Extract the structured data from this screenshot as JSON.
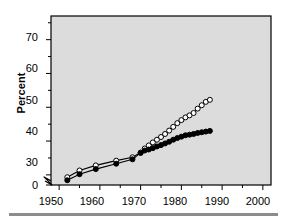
{
  "chart_data": {
    "type": "line",
    "title": "",
    "subtitle": "",
    "xlabel": "",
    "ylabel": "Percent",
    "xlim": [
      1948,
      2002
    ],
    "ylim": [
      27,
      77
    ],
    "y_axis_break": {
      "present": true,
      "from": 0,
      "to": 27,
      "zero_label": "0"
    },
    "grid": false,
    "legend_position": "inline-annotations",
    "plot_background": "#dcdcdc",
    "xticks": [
      1950,
      1960,
      1970,
      1980,
      1990,
      2000
    ],
    "xticklabels": [
      "1950",
      "1960",
      "1970",
      "1980",
      "1990",
      "2000"
    ],
    "xminor_ticks": [
      1955,
      1965,
      1975,
      1985,
      1995
    ],
    "yticks": [
      30,
      40,
      50,
      60,
      70
    ],
    "yticklabels": [
      "30",
      "40",
      "50",
      "60",
      "70"
    ],
    "yminor_ticks": [
      35,
      45,
      55,
      65,
      75
    ],
    "zero_tick_label": "0",
    "series": [
      {
        "name": "Percent of Female Population",
        "marker": "open-circle",
        "marker_fill": "#ffffff",
        "marker_edge": "#000000",
        "line_color": "#000000",
        "x": [
          1952,
          1955,
          1959,
          1964,
          1968,
          1970,
          1971,
          1972,
          1973,
          1974,
          1975,
          1976,
          1977,
          1978,
          1979,
          1980,
          1981,
          1982,
          1983,
          1984,
          1985,
          1986,
          1987
        ],
        "y": [
          29.3,
          31.3,
          32.8,
          34.2,
          35.2,
          36.6,
          37.8,
          38.7,
          39.6,
          40.4,
          41.2,
          42.1,
          43.1,
          44.2,
          45.3,
          46.2,
          47.0,
          47.6,
          48.3,
          49.6,
          50.6,
          51.6,
          52.2
        ]
      },
      {
        "name": "Percent of Labor Force",
        "marker": "filled-circle",
        "marker_fill": "#000000",
        "marker_edge": "#000000",
        "line_color": "#000000",
        "x": [
          1952,
          1955,
          1959,
          1964,
          1968,
          1970,
          1971,
          1972,
          1973,
          1974,
          1975,
          1976,
          1977,
          1978,
          1979,
          1980,
          1981,
          1982,
          1983,
          1984,
          1985,
          1986,
          1987
        ],
        "y": [
          28.4,
          30.2,
          31.7,
          33.3,
          34.6,
          36.5,
          37.2,
          37.5,
          37.9,
          38.4,
          38.8,
          39.3,
          39.8,
          40.4,
          40.9,
          41.3,
          41.7,
          41.9,
          42.1,
          42.4,
          42.6,
          42.8,
          43.0
        ]
      }
    ],
    "annotations": [
      {
        "id": "annot-female-population",
        "lines": [
          "Percent of",
          "Female Population"
        ],
        "x": 1955.5,
        "y": 51.0
      },
      {
        "id": "annot-labor-force",
        "lines": [
          "Percent of",
          "Labor Force"
        ],
        "x": 1974.5,
        "y": 32.5
      }
    ],
    "colors": {
      "axis": "#000000",
      "plot_background": "#dcdcdc",
      "page_background": "#ffffff",
      "rule": "#8c8c8c"
    }
  }
}
